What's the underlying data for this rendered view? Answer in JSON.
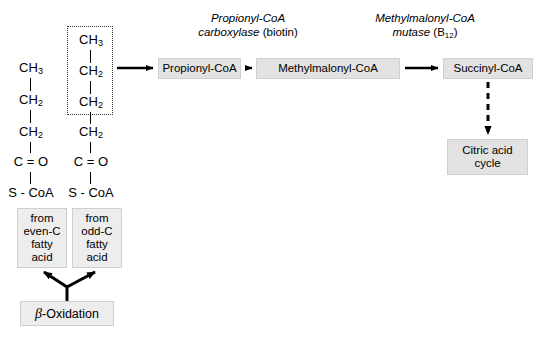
{
  "diagram": {
    "colors": {
      "box_fill": "#e2e2e2",
      "box_fill_pale": "#ededed",
      "stroke": "#000000",
      "background": "#ffffff"
    }
  },
  "structures": {
    "even_chain": {
      "name": "even-carbon acyl-CoA",
      "atoms": [
        "CH3",
        "CH2",
        "CH2",
        "C = O",
        "S - CoA"
      ]
    },
    "odd_chain": {
      "name": "odd-carbon acyl-CoA",
      "atoms": [
        "CH3",
        "CH2",
        "CH2",
        "CH2",
        "C = O",
        "S - CoA"
      ],
      "highlight_note": "dotted box encloses top three carbons"
    }
  },
  "enzymes": [
    {
      "id": "propionyl-coa-carboxylase",
      "line1_italic": "Propionyl-CoA",
      "line2_italic": "carboxylase",
      "line2_plain": " (biotin)",
      "cofactor": "biotin"
    },
    {
      "id": "methylmalonyl-coa-mutase",
      "line1_italic": "Methylmalonyl-CoA",
      "line2_italic": "mutase",
      "line2_plain": " (B",
      "subscript": "12",
      "line2_plain_end": ")",
      "cofactor": "B12"
    }
  ],
  "metabolites": {
    "propionyl_coa": "Propionyl-CoA",
    "methylmalonyl_coa": "Methylmalonyl-CoA",
    "succinyl_coa": "Succinyl-CoA",
    "citric_acid_cycle_line1": "Citric acid",
    "citric_acid_cycle_line2": "cycle"
  },
  "sources": {
    "even": {
      "line1": "from",
      "line2": "even-C",
      "line3": "fatty",
      "line4": "acid"
    },
    "odd": {
      "line1": "from",
      "line2": "odd-C",
      "line3": "fatty",
      "line4": "acid"
    },
    "beta_oxidation_symbol": "β",
    "beta_oxidation_text": "-Oxidation"
  },
  "chem_labels": {
    "ch3": "CH",
    "ch3_sub": "3",
    "ch2": "CH",
    "ch2_sub": "2",
    "carbonyl": "C = O",
    "scoa": "S - CoA"
  }
}
